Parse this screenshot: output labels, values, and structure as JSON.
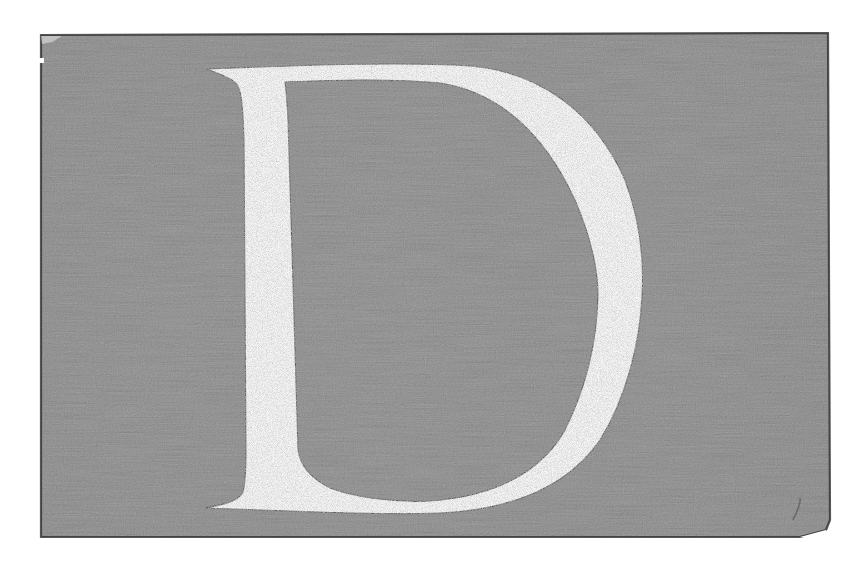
{
  "image": {
    "description": "Scanned decorative initial capital letter on textured gray panel",
    "letter": "D",
    "colors": {
      "page_background": "#ffffff",
      "panel_fill": "#a2a2a2",
      "panel_dark": "#7c7c7c",
      "panel_light": "#c2c2c2",
      "panel_border": "#2e2e2e",
      "letter_fill": "#f5f5f5",
      "letter_outline": "#3a3a3a"
    }
  }
}
